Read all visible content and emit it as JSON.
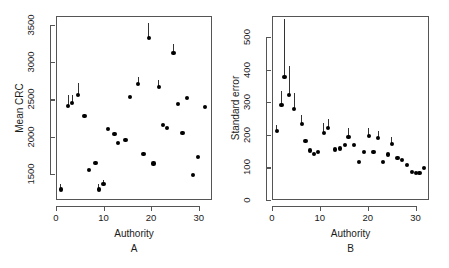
{
  "chart_data": [
    {
      "type": "scatter",
      "panel": "A",
      "title": "",
      "xlabel": "Authority",
      "ylabel": "Mean CRC",
      "xlim": [
        0,
        32.8
      ],
      "ylim": [
        1150,
        3620
      ],
      "xticks": [
        0,
        10,
        20,
        30
      ],
      "yticks": [
        1500,
        2000,
        2500,
        3000,
        3500
      ],
      "grid": false,
      "legend": null,
      "x": [
        1,
        2.6,
        3.4,
        4.7,
        6,
        7,
        8.3,
        9,
        10,
        11,
        12.3,
        13,
        14.6,
        15.6,
        17.3,
        18.4,
        19.5,
        20.5,
        21.6,
        22.5,
        23.4,
        24.7,
        25.6,
        26.6,
        27.6,
        28.8,
        29.8,
        31.4
      ],
      "y": [
        1290,
        2410,
        2450,
        2560,
        2280,
        1550,
        1650,
        1290,
        1360,
        2100,
        2040,
        1920,
        1950,
        2530,
        2710,
        1770,
        3330,
        1640,
        2670,
        2160,
        2120,
        3120,
        2440,
        2050,
        2520,
        1490,
        1730,
        2400
      ],
      "error_up": [
        80,
        145,
        115,
        160,
        0,
        0,
        0,
        75,
        60,
        0,
        0,
        0,
        0,
        0,
        90,
        0,
        195,
        0,
        95,
        0,
        0,
        125,
        0,
        0,
        0,
        0,
        0,
        0
      ]
    },
    {
      "type": "scatter",
      "panel": "B",
      "title": "",
      "xlabel": "Authority",
      "ylabel": "Standard error",
      "xlim": [
        0,
        32.8
      ],
      "ylim": [
        0,
        565
      ],
      "xticks": [
        0,
        10,
        20,
        30
      ],
      "yticks": [
        0,
        100,
        200,
        300,
        400,
        500
      ],
      "grid": false,
      "legend": null,
      "x": [
        1,
        2,
        2.6,
        3.6,
        4.6,
        6.2,
        7,
        8,
        8.8,
        9.6,
        10.8,
        11.7,
        13.2,
        14.2,
        15.2,
        16,
        17.2,
        18.2,
        19.2,
        20.2,
        21.2,
        22.2,
        23.2,
        24.2,
        25,
        26.2,
        27.2,
        28.2,
        29.2,
        30,
        30.8,
        31.8
      ],
      "y": [
        212,
        292,
        378,
        322,
        280,
        233,
        182,
        152,
        142,
        148,
        206,
        220,
        155,
        158,
        168,
        194,
        168,
        117,
        148,
        196,
        148,
        190,
        117,
        140,
        172,
        130,
        122,
        108,
        86,
        84,
        84,
        98
      ],
      "error_up": [
        18,
        42,
        178,
        88,
        48,
        28,
        0,
        0,
        0,
        0,
        30,
        28,
        0,
        0,
        0,
        26,
        0,
        0,
        0,
        26,
        0,
        22,
        0,
        0,
        22,
        0,
        0,
        0,
        0,
        0,
        0,
        0
      ]
    }
  ],
  "panels": [
    {
      "id": "A",
      "letter": "A",
      "xlabel": "Authority",
      "ylabel": "Mean CRC",
      "yticklabels": [
        "1500",
        "2000",
        "2500",
        "3000",
        "3500"
      ],
      "xticklabels": [
        "0",
        "10",
        "20",
        "30"
      ]
    },
    {
      "id": "B",
      "letter": "B",
      "xlabel": "Authority",
      "ylabel": "Standard error",
      "yticklabels": [
        "0",
        "100",
        "200",
        "300",
        "400",
        "500"
      ],
      "xticklabels": [
        "0",
        "10",
        "20",
        "30"
      ]
    }
  ],
  "colors": {
    "marker": "#000000",
    "axis": "#555555",
    "background": "#ffffff"
  }
}
